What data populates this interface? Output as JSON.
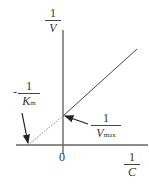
{
  "diagram": {
    "y_axis_label": {
      "numerator": "1",
      "denominator": "V"
    },
    "x_axis_label": {
      "numerator": "1",
      "denominator": "C"
    },
    "origin_label": "0",
    "x_intercept_label": {
      "sign": "-",
      "numerator": "1",
      "denominator": "K",
      "subscript": "m"
    },
    "y_intercept_label": {
      "numerator": "1",
      "denominator": "V",
      "subscript": "max"
    }
  }
}
